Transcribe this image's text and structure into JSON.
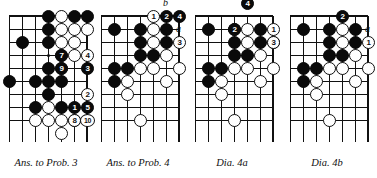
{
  "page": {
    "kind": "go-game-diagrams",
    "diagram_count": 4,
    "ink_color": "#111111",
    "black_stone_color": "#0a0a0a",
    "white_stone_color": "#ffffff",
    "background_color": "#ffffff"
  },
  "diagrams": [
    {
      "id": "ans-to-prob-3",
      "caption": "Ans. to Prob. 3",
      "grid": {
        "cols": 7,
        "rows": 9,
        "spacing": 13,
        "origin_x": 9,
        "origin_y": 16,
        "top_edge": true,
        "right_edge": true,
        "hoshi": [
          [
            3,
            3
          ]
        ]
      },
      "black_stones": [
        [
          3,
          0
        ],
        [
          5,
          0
        ],
        [
          6,
          0
        ],
        [
          3,
          1
        ],
        [
          3,
          2
        ],
        [
          1,
          2
        ],
        [
          3,
          4
        ],
        [
          0,
          5
        ],
        [
          2,
          5
        ],
        [
          3,
          5
        ],
        [
          4,
          5
        ],
        [
          3,
          6
        ],
        [
          2,
          7
        ],
        [
          4,
          7
        ]
      ],
      "white_stones": [
        [
          4,
          0
        ],
        [
          4,
          1
        ],
        [
          5,
          1
        ],
        [
          6,
          1
        ],
        [
          4,
          2
        ],
        [
          5,
          2
        ],
        [
          4,
          4
        ],
        [
          4,
          3
        ],
        [
          5,
          3
        ],
        [
          3,
          7
        ],
        [
          2,
          8
        ],
        [
          3,
          8
        ],
        [
          4,
          8
        ],
        [
          5,
          8
        ],
        [
          4,
          9
        ]
      ],
      "numbered_stones": [
        {
          "num": "1",
          "color": "black",
          "col": 5,
          "row": 7
        },
        {
          "num": "2",
          "color": "white",
          "col": 6,
          "row": 6
        },
        {
          "num": "3",
          "color": "black",
          "col": 6,
          "row": 4
        },
        {
          "num": "4",
          "color": "white",
          "col": 6,
          "row": 3
        },
        {
          "num": "5",
          "color": "black",
          "col": 6,
          "row": 7
        },
        {
          "num": "7",
          "color": "black",
          "col": 4,
          "row": 3
        },
        {
          "num": "8",
          "color": "white",
          "col": 5,
          "row": 8
        },
        {
          "num": "9",
          "color": "black",
          "col": 4,
          "row": 4
        },
        {
          "num": "10",
          "color": "white",
          "col": 6,
          "row": 8
        }
      ],
      "letter_markers": []
    },
    {
      "id": "ans-to-prob-4",
      "caption": "Ans. to Prob. 4",
      "grid": {
        "cols": 7,
        "rows": 9,
        "spacing": 13,
        "origin_x": 9,
        "origin_y": 16,
        "top_edge": true,
        "right_edge": true,
        "hoshi": []
      },
      "black_stones": [
        [
          1,
          1
        ],
        [
          3,
          1
        ],
        [
          5,
          1
        ],
        [
          3,
          2
        ],
        [
          5,
          2
        ],
        [
          3,
          3
        ],
        [
          4,
          3
        ],
        [
          1,
          4
        ],
        [
          2,
          4
        ],
        [
          1,
          5
        ]
      ],
      "white_stones": [
        [
          4,
          1
        ],
        [
          4,
          2
        ],
        [
          5,
          3
        ],
        [
          3,
          4
        ],
        [
          4,
          4
        ],
        [
          6,
          4
        ],
        [
          2,
          5
        ],
        [
          5,
          5
        ],
        [
          2,
          6
        ],
        [
          3,
          8
        ]
      ],
      "numbered_stones": [
        {
          "num": "1",
          "color": "white",
          "col": 4,
          "row": 0
        },
        {
          "num": "2",
          "color": "black",
          "col": 5,
          "row": 0
        },
        {
          "num": "3",
          "color": "white",
          "col": 6,
          "row": 2
        },
        {
          "num": "4",
          "color": "black",
          "col": 6,
          "row": 0
        }
      ],
      "letter_markers": [
        {
          "label": "b",
          "col": 5,
          "row": -1
        },
        {
          "label": "a",
          "col": 6,
          "row": 1
        }
      ]
    },
    {
      "id": "dia-4a",
      "caption": "Dia.   4a",
      "grid": {
        "cols": 7,
        "rows": 9,
        "spacing": 13,
        "origin_x": 9,
        "origin_y": 16,
        "top_edge": true,
        "right_edge": true,
        "hoshi": []
      },
      "black_stones": [
        [
          1,
          1
        ],
        [
          3,
          1
        ],
        [
          5,
          1
        ],
        [
          3,
          2
        ],
        [
          5,
          2
        ],
        [
          3,
          3
        ],
        [
          4,
          3
        ],
        [
          1,
          4
        ],
        [
          2,
          4
        ],
        [
          1,
          5
        ]
      ],
      "white_stones": [
        [
          4,
          1
        ],
        [
          4,
          2
        ],
        [
          5,
          3
        ],
        [
          3,
          4
        ],
        [
          4,
          4
        ],
        [
          6,
          4
        ],
        [
          2,
          5
        ],
        [
          5,
          5
        ],
        [
          2,
          6
        ],
        [
          3,
          8
        ],
        [
          6,
          2
        ]
      ],
      "numbered_stones": [
        {
          "num": "1",
          "color": "white",
          "col": 6,
          "row": 1
        },
        {
          "num": "2",
          "color": "black",
          "col": 3,
          "row": 1
        },
        {
          "num": "3",
          "color": "white",
          "col": 6,
          "row": 2
        },
        {
          "num": "4",
          "color": "black",
          "col": 4,
          "row": -1
        }
      ],
      "letter_markers": []
    },
    {
      "id": "dia-4b",
      "caption": "Dia.   4b",
      "grid": {
        "cols": 7,
        "rows": 9,
        "spacing": 13,
        "origin_x": 9,
        "origin_y": 16,
        "top_edge": true,
        "right_edge": true,
        "hoshi": []
      },
      "black_stones": [
        [
          1,
          1
        ],
        [
          3,
          1
        ],
        [
          5,
          1
        ],
        [
          3,
          2
        ],
        [
          5,
          2
        ],
        [
          3,
          3
        ],
        [
          4,
          3
        ],
        [
          1,
          4
        ],
        [
          2,
          4
        ],
        [
          1,
          5
        ]
      ],
      "white_stones": [
        [
          4,
          1
        ],
        [
          4,
          2
        ],
        [
          5,
          3
        ],
        [
          3,
          4
        ],
        [
          4,
          4
        ],
        [
          6,
          4
        ],
        [
          2,
          5
        ],
        [
          5,
          5
        ],
        [
          2,
          6
        ],
        [
          3,
          8
        ]
      ],
      "numbered_stones": [
        {
          "num": "1",
          "color": "white",
          "col": 6,
          "row": 2
        },
        {
          "num": "2",
          "color": "black",
          "col": 4,
          "row": 0
        }
      ],
      "letter_markers": [
        {
          "label": "a",
          "col": 6,
          "row": 1
        }
      ]
    }
  ]
}
